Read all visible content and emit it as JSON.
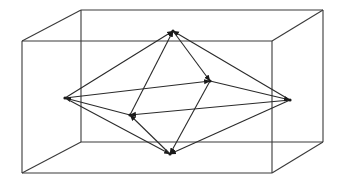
{
  "diagram": {
    "title": "",
    "colors": {
      "background": "#ffffff",
      "box_stroke": "#3a3a3a",
      "edge_stroke": "#2a2a2a",
      "arrow_fill": "#1a1a1a"
    },
    "box": {
      "vertices": {
        "front_top_left": [
          22,
          41
        ],
        "front_top_right": [
          272,
          41
        ],
        "front_bottom_left": [
          22,
          173
        ],
        "front_bottom_right": [
          272,
          173
        ],
        "back_top_left": [
          81,
          10
        ],
        "back_top_right": [
          323,
          10
        ],
        "back_bottom_left": [
          81,
          142
        ],
        "back_bottom_right": [
          323,
          142
        ]
      },
      "edges": [
        [
          "front_top_left",
          "front_top_right"
        ],
        [
          "front_top_right",
          "front_bottom_right"
        ],
        [
          "front_bottom_right",
          "front_bottom_left"
        ],
        [
          "front_bottom_left",
          "front_top_left"
        ],
        [
          "back_top_left",
          "back_top_right"
        ],
        [
          "back_top_right",
          "back_bottom_right"
        ],
        [
          "back_bottom_right",
          "back_bottom_left"
        ],
        [
          "back_bottom_left",
          "back_top_left"
        ],
        [
          "front_top_left",
          "back_top_left"
        ],
        [
          "front_top_right",
          "back_top_right"
        ],
        [
          "front_bottom_left",
          "back_bottom_left"
        ],
        [
          "front_bottom_right",
          "back_bottom_right"
        ]
      ]
    },
    "octahedron": {
      "vertices": {
        "top": [
          173,
          31
        ],
        "bottom": [
          170,
          154
        ],
        "left": [
          65,
          98
        ],
        "right": [
          290,
          100
        ],
        "mid_back": [
          210,
          81
        ],
        "mid_front": [
          130,
          115
        ]
      },
      "edges": [
        [
          "left",
          "top"
        ],
        [
          "right",
          "top"
        ],
        [
          "top",
          "mid_back"
        ],
        [
          "mid_front",
          "top"
        ],
        [
          "left",
          "mid_back"
        ],
        [
          "right",
          "mid_front"
        ],
        [
          "mid_front",
          "left"
        ],
        [
          "mid_back",
          "right"
        ],
        [
          "left",
          "bottom"
        ],
        [
          "right",
          "bottom"
        ],
        [
          "bottom",
          "mid_front"
        ],
        [
          "mid_back",
          "bottom"
        ]
      ]
    }
  }
}
